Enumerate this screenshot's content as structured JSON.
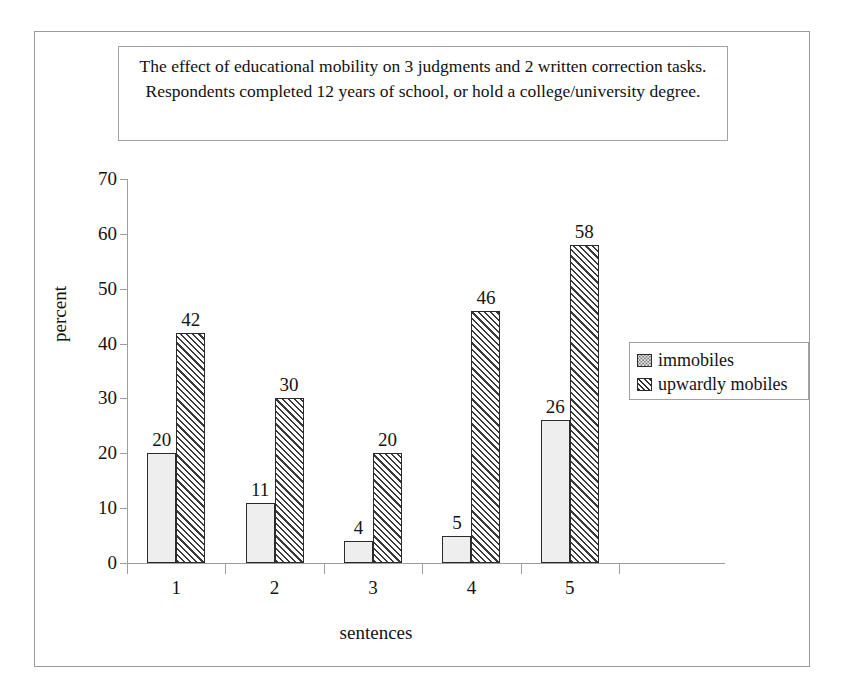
{
  "title": {
    "text": "The effect of educational mobility on 3 judgments and 2 written correction tasks. Respondents completed 12 years of school, or hold a college/university degree."
  },
  "chart_data": {
    "type": "bar",
    "title": "The effect of educational mobility on 3 judgments and 2 written correction tasks. Respondents completed 12 years of school, or hold a college/university degree.",
    "xlabel": "sentences",
    "ylabel": "percent",
    "categories": [
      "1",
      "2",
      "3",
      "4",
      "5"
    ],
    "series": [
      {
        "name": "immobiles",
        "pattern": "dotted",
        "values": [
          20,
          11,
          4,
          5,
          26
        ]
      },
      {
        "name": "upwardly mobiles",
        "pattern": "diagonal-hatch",
        "values": [
          42,
          30,
          20,
          46,
          58
        ]
      }
    ],
    "ylim": [
      0,
      70
    ],
    "ytick_labels": [
      "0",
      "10",
      "20",
      "30",
      "40",
      "50",
      "60",
      "70"
    ],
    "ytick_values": [
      0,
      10,
      20,
      30,
      40,
      50,
      60,
      70
    ],
    "grid": false,
    "data_labels": true,
    "legend_position": "right"
  },
  "legend": {
    "items": [
      {
        "label": "immobiles",
        "swatch": "dotted-swatch-icon"
      },
      {
        "label": "upwardly mobiles",
        "swatch": "hatched-swatch-icon"
      }
    ]
  }
}
